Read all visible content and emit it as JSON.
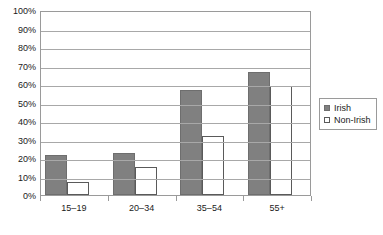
{
  "chart_data": {
    "type": "bar",
    "title": "",
    "subtitle": "",
    "xlabel": "",
    "ylabel": "",
    "categories": [
      "15–19",
      "20–34",
      "35–54",
      "55+"
    ],
    "series": [
      {
        "name": "Irish",
        "values": [
          21.8,
          22.7,
          56.8,
          66.5
        ],
        "color": "#808080"
      },
      {
        "name": "Non-Irish",
        "values": [
          7.0,
          15.0,
          31.8,
          58.8
        ],
        "color": "#ffffff"
      }
    ],
    "ylim": [
      0,
      100
    ],
    "ytick_labels": [
      "100%",
      "90%",
      "80%",
      "70%",
      "60%",
      "50%",
      "40%",
      "30%",
      "20%",
      "10%",
      "0%"
    ],
    "ytick_values": [
      100,
      90,
      80,
      70,
      60,
      50,
      40,
      30,
      20,
      10,
      0
    ],
    "grid": true,
    "grid_axis": "y",
    "legend_position": "right",
    "legend_entries": [
      "Irish",
      "Non-Irish"
    ],
    "annotations": []
  },
  "legend": {
    "items": [
      {
        "label": "Irish",
        "swatch": "filled-square-icon"
      },
      {
        "label": "Non-Irish",
        "swatch": "outline-square-icon"
      }
    ]
  }
}
